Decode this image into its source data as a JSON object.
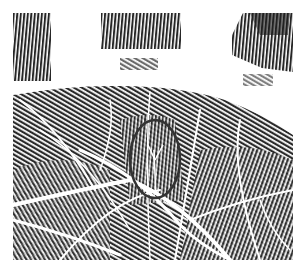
{
  "image": {
    "subject": "palm print",
    "annotation": "ellipse highlighting ridge bifurcation",
    "colors": {
      "ink": "#2a2a2a",
      "paper": "#ffffff",
      "ellipse": "#333333"
    }
  }
}
